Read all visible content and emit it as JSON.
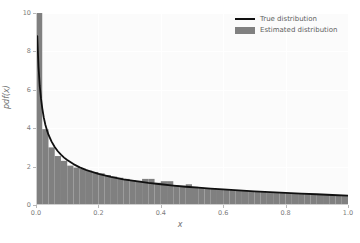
{
  "chart_data": {
    "type": "area",
    "title": "",
    "xlabel": "x",
    "ylabel": "pdf(x)",
    "xlim": [
      0.0,
      1.0
    ],
    "ylim": [
      0.0,
      10.0
    ],
    "grid": true,
    "legend_position": "upper right",
    "xticks": [
      "0.0",
      "0.2",
      "0.4",
      "0.6",
      "0.8",
      "1.0"
    ],
    "xtick_values": [
      0.0,
      0.2,
      0.4,
      0.6,
      0.8,
      1.0
    ],
    "yticks": [
      "0",
      "2",
      "4",
      "6",
      "8",
      "10"
    ],
    "ytick_values": [
      0,
      2,
      4,
      6,
      8,
      10
    ],
    "series": [
      {
        "name": "True distribution",
        "kind": "line",
        "color": "#101010",
        "x": [
          0.004,
          0.008,
          0.012,
          0.016,
          0.02,
          0.025,
          0.03,
          0.035,
          0.04,
          0.05,
          0.06,
          0.07,
          0.08,
          0.09,
          0.1,
          0.12,
          0.14,
          0.16,
          0.18,
          0.2,
          0.24,
          0.28,
          0.32,
          0.36,
          0.4,
          0.44,
          0.48,
          0.52,
          0.56,
          0.6,
          0.65,
          0.7,
          0.75,
          0.8,
          0.85,
          0.9,
          0.95,
          1.0
        ],
        "values": [
          8.8,
          7.2,
          6.2,
          5.55,
          5.05,
          4.55,
          4.18,
          3.9,
          3.66,
          3.3,
          3.02,
          2.8,
          2.62,
          2.47,
          2.34,
          2.13,
          1.96,
          1.83,
          1.72,
          1.62,
          1.46,
          1.34,
          1.24,
          1.15,
          1.08,
          1.01,
          0.95,
          0.9,
          0.85,
          0.81,
          0.76,
          0.71,
          0.67,
          0.63,
          0.59,
          0.56,
          0.52,
          0.49
        ]
      },
      {
        "name": "Estimated distribution",
        "kind": "bar",
        "color": "#808080",
        "bin_edges": [
          0.0,
          0.02,
          0.04,
          0.06,
          0.08,
          0.1,
          0.12,
          0.14,
          0.16,
          0.18,
          0.2,
          0.22,
          0.24,
          0.26,
          0.28,
          0.3,
          0.32,
          0.34,
          0.36,
          0.38,
          0.4,
          0.42,
          0.44,
          0.46,
          0.48,
          0.5,
          0.52,
          0.54,
          0.56,
          0.58,
          0.6,
          0.62,
          0.64,
          0.66,
          0.68,
          0.7,
          0.72,
          0.74,
          0.76,
          0.78,
          0.8,
          0.82,
          0.84,
          0.86,
          0.88,
          0.9,
          0.92,
          0.94,
          0.96,
          0.98,
          1.0
        ],
        "values": [
          10.0,
          3.95,
          3.0,
          2.55,
          2.3,
          2.05,
          1.95,
          1.88,
          1.8,
          1.72,
          1.65,
          1.56,
          1.48,
          1.42,
          1.36,
          1.3,
          1.26,
          1.36,
          1.36,
          1.16,
          1.24,
          1.24,
          1.02,
          1.0,
          1.08,
          0.95,
          0.9,
          0.88,
          0.86,
          0.83,
          0.81,
          0.78,
          0.76,
          0.74,
          0.72,
          0.7,
          0.68,
          0.66,
          0.65,
          0.63,
          0.62,
          0.6,
          0.59,
          0.57,
          0.56,
          0.55,
          0.53,
          0.52,
          0.51,
          0.5
        ]
      }
    ]
  },
  "legend": {
    "items": [
      {
        "label": "True distribution"
      },
      {
        "label": "Estimated distribution"
      }
    ]
  },
  "colors": {
    "line": "#101010",
    "bars": "#808080",
    "plot_background": "#fbfbfb",
    "grid": "#ffffff",
    "tick_text": "#7b7b7b"
  }
}
